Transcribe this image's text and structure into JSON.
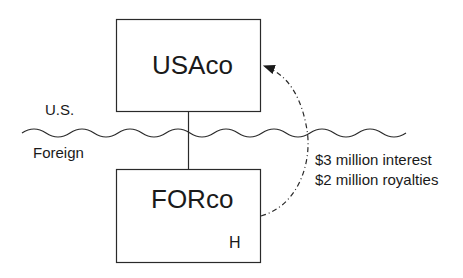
{
  "diagram": {
    "entities": [
      {
        "id": "usaco",
        "label": "USAco"
      },
      {
        "id": "forco",
        "label": "FORco",
        "marker": "H"
      }
    ],
    "regions": {
      "upper": "U.S.",
      "lower": "Foreign"
    },
    "flow": {
      "from": "FORco",
      "to": "USAco",
      "lines": [
        "$3 million interest",
        "$2 million royalties"
      ]
    }
  }
}
